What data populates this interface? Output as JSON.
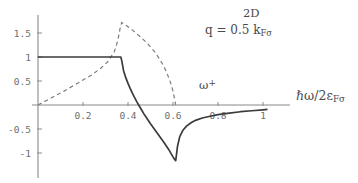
{
  "figure": {
    "background_color": "#ffffff",
    "solid_color": "#3b3b3b",
    "dashed_color": "#7b7b7b",
    "axis_color": "#8a8a8a"
  },
  "annotations": {
    "title_dimension": "2D",
    "title_q_prefix": "q = 0.5 k",
    "title_q_subscript": "Fσ",
    "xaxis_label_main": "ℏω/2ε",
    "xaxis_label_subscript": "Fσ",
    "omega_plus_base": "ω",
    "omega_plus_sub": "+"
  },
  "chart_data": {
    "type": "line",
    "xlabel": "ℏω/2ε_Fσ",
    "ylabel": "",
    "xlim": [
      -0.03,
      1.06
    ],
    "ylim": [
      -1.35,
      1.85
    ],
    "grid": false,
    "legend": null,
    "xticks": [
      0.2,
      0.4,
      0.6,
      0.8,
      1
    ],
    "xtick_labels": [
      "0.2",
      "0.4",
      "0.6",
      "0.8",
      "1"
    ],
    "yticks": [
      1.5,
      1,
      0.5,
      -0.5,
      -1
    ],
    "ytick_labels": [
      "1.5",
      "1",
      "0.5",
      "-0.5",
      "-1"
    ],
    "annotation_points": [
      {
        "label": "ω+",
        "x": 0.61,
        "y": 0.0
      }
    ],
    "series": [
      {
        "name": "real part (solid)",
        "style": "solid",
        "color": "#3b3b3b",
        "x": [
          0.0,
          0.05,
          0.1,
          0.15,
          0.2,
          0.25,
          0.3,
          0.34,
          0.365,
          0.368,
          0.372,
          0.38,
          0.39,
          0.4,
          0.41,
          0.42,
          0.43,
          0.44,
          0.45,
          0.46,
          0.47,
          0.48,
          0.5,
          0.52,
          0.54,
          0.56,
          0.58,
          0.6,
          0.608,
          0.612,
          0.615,
          0.62,
          0.63,
          0.645,
          0.66,
          0.68,
          0.7,
          0.73,
          0.76,
          0.8,
          0.85,
          0.9,
          0.95,
          1.0,
          1.02
        ],
        "y": [
          1.0,
          1.0,
          1.0,
          1.0,
          1.0,
          1.0,
          1.0,
          1.0,
          1.0,
          1.0,
          0.93,
          0.72,
          0.57,
          0.45,
          0.34,
          0.24,
          0.15,
          0.06,
          -0.02,
          -0.1,
          -0.18,
          -0.25,
          -0.39,
          -0.52,
          -0.65,
          -0.78,
          -0.92,
          -1.08,
          -1.14,
          -1.16,
          -1.05,
          -0.86,
          -0.66,
          -0.52,
          -0.44,
          -0.37,
          -0.32,
          -0.27,
          -0.24,
          -0.2,
          -0.17,
          -0.14,
          -0.12,
          -0.1,
          -0.09
        ]
      },
      {
        "name": "imaginary part (dashed)",
        "style": "dashed",
        "color": "#7b7b7b",
        "x": [
          0.0,
          0.04,
          0.08,
          0.12,
          0.16,
          0.2,
          0.24,
          0.28,
          0.31,
          0.34,
          0.355,
          0.365,
          0.372,
          0.385,
          0.4,
          0.42,
          0.44,
          0.46,
          0.48,
          0.5,
          0.52,
          0.54,
          0.555,
          0.57,
          0.585,
          0.595,
          0.603,
          0.608,
          0.612
        ],
        "y": [
          0.0,
          0.1,
          0.2,
          0.3,
          0.41,
          0.52,
          0.63,
          0.77,
          0.9,
          1.12,
          1.35,
          1.6,
          1.72,
          1.68,
          1.63,
          1.56,
          1.48,
          1.4,
          1.31,
          1.21,
          1.1,
          0.96,
          0.84,
          0.7,
          0.52,
          0.38,
          0.22,
          0.1,
          0.0
        ]
      }
    ]
  }
}
